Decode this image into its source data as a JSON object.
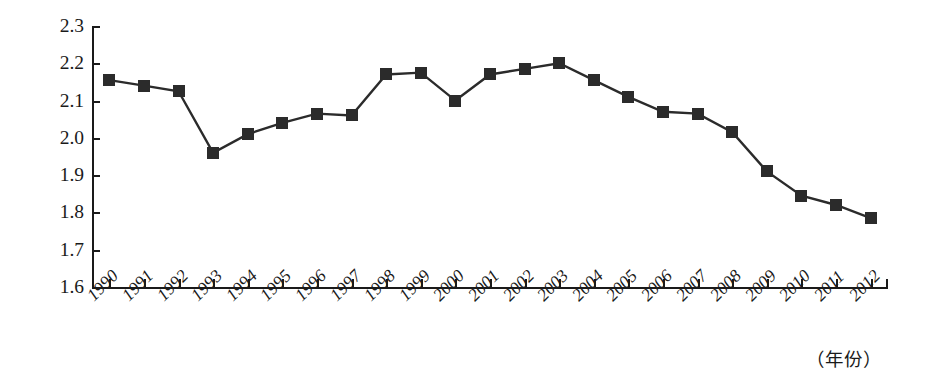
{
  "chart_data": {
    "type": "line",
    "title": "",
    "subtitle": "",
    "xlabel": "（年份）",
    "ylabel": "",
    "grid": false,
    "legend": "none",
    "marker": "filled-square",
    "line_color": "#2b2b2b",
    "marker_color": "#2b2b2b",
    "xlim": [
      1990,
      2012
    ],
    "ylim": [
      1.6,
      2.3
    ],
    "ytick_step": 0.1,
    "ytick_labels": [
      "2.3",
      "2.2",
      "2.1",
      "2.0",
      "1.9",
      "1.8",
      "1.7",
      "1.6"
    ],
    "ytick_values": [
      2.3,
      2.2,
      2.1,
      2.0,
      1.9,
      1.8,
      1.7,
      1.6
    ],
    "categories": [
      "1990",
      "1991",
      "1992",
      "1993",
      "1994",
      "1995",
      "1996",
      "1997",
      "1998",
      "1999",
      "2000",
      "2001",
      "2002",
      "2003",
      "2004",
      "2005",
      "2006",
      "2007",
      "2008",
      "2009",
      "2010",
      "2011",
      "2012"
    ],
    "values": [
      2.155,
      2.14,
      2.125,
      1.96,
      2.01,
      2.04,
      2.065,
      2.06,
      2.17,
      2.175,
      2.1,
      2.17,
      2.185,
      2.2,
      2.155,
      2.11,
      2.07,
      2.065,
      2.015,
      1.91,
      1.845,
      1.82,
      1.785
    ],
    "annotations": []
  }
}
